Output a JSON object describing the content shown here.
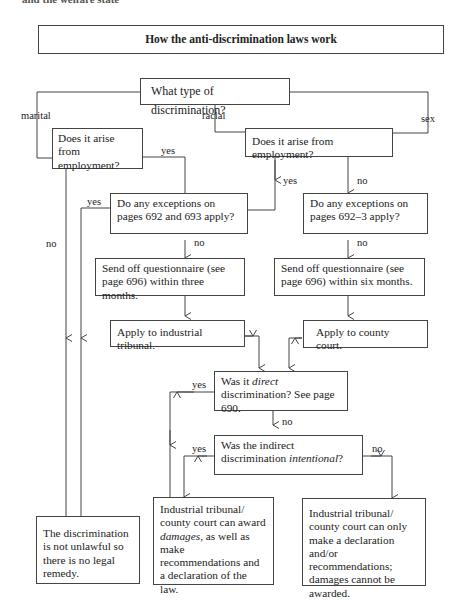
{
  "page_header": "and the welfare state",
  "title": "How the anti-discrimination laws work",
  "nodes": {
    "type_question": "What type of discrimination?",
    "marital_employment": "Does it arise from employment?",
    "racial_sex_employment": "Does it arise from employment?",
    "exceptions_692_693": "Do any exceptions on pages 692 and 693 apply?",
    "exceptions_692_3": "Do any exceptions on pages 692–3 apply?",
    "questionnaire_three": "Send off questionnaire (see page 696) within three months.",
    "questionnaire_six": "Send off questionnaire (see page 696) within six months.",
    "industrial_tribunal": "Apply to industrial tribunal.",
    "county_court": "Apply to county court.",
    "direct_q_pre": "Was it ",
    "direct_q_em": "direct",
    "direct_q_post": " discrimination? See page 690.",
    "intentional_q_pre": "Was the indirect discrimination ",
    "intentional_q_em": "intentional",
    "intentional_q_post": "?",
    "not_unlawful": "The discrimination is not unlawful so there is no legal remedy.",
    "damages_pre": "Industrial tribunal/ county court can award ",
    "damages_em": "damages",
    "damages_post": ", as well as make recommendations and a declaration of the law.",
    "declaration_only": "Industrial tribunal/ county court can only make a declaration and/or recommendations; damages cannot be awarded."
  },
  "edge_labels": {
    "marital": "marital",
    "racial": "racial",
    "sex": "sex",
    "yes1": "yes",
    "yes2": "yes",
    "yes3": "yes",
    "no1": "no",
    "no2": "no",
    "no3": "no",
    "no4": "no",
    "yes4": "yes",
    "no5": "no",
    "yes5": "yes",
    "no6": "no"
  }
}
